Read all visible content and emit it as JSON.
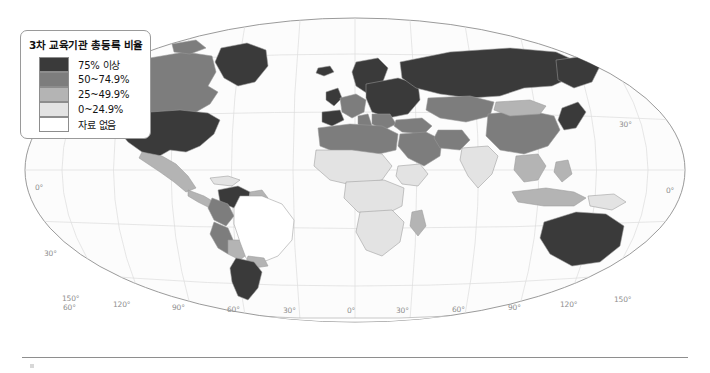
{
  "legend": {
    "title": "3차 교육기관 총등록 비율",
    "items": [
      {
        "label": "75% 이상",
        "color": "#3a3a3a"
      },
      {
        "label": "50~74.9%",
        "color": "#7d7d7d"
      },
      {
        "label": "25~49.9%",
        "color": "#b4b4b4"
      },
      {
        "label": "0~24.9%",
        "color": "#e3e3e3"
      },
      {
        "label": "자료 없음",
        "color": "#ffffff"
      }
    ]
  },
  "graticule": {
    "longitude_labels": [
      {
        "text": "150°",
        "x": 62,
        "y": 294
      },
      {
        "text": "120°",
        "x": 113,
        "y": 300
      },
      {
        "text": "90°",
        "x": 172,
        "y": 303
      },
      {
        "text": "60°",
        "x": 227,
        "y": 305
      },
      {
        "text": "30°",
        "x": 283,
        "y": 306
      },
      {
        "text": "0°",
        "x": 347,
        "y": 306
      },
      {
        "text": "30°",
        "x": 396,
        "y": 306
      },
      {
        "text": "60°",
        "x": 452,
        "y": 305
      },
      {
        "text": "90°",
        "x": 508,
        "y": 303
      },
      {
        "text": "120°",
        "x": 560,
        "y": 300
      },
      {
        "text": "150°",
        "x": 614,
        "y": 295
      }
    ],
    "latitude_labels": [
      {
        "text": "30°",
        "x": 619,
        "y": 120
      },
      {
        "text": "0°",
        "x": 35,
        "y": 183
      },
      {
        "text": "0°",
        "x": 666,
        "y": 186
      },
      {
        "text": "30°",
        "x": 44,
        "y": 249
      },
      {
        "text": "60°",
        "x": 63,
        "y": 303
      }
    ]
  },
  "map": {
    "projection": "mollweide",
    "ocean_color": "#fcfcfc",
    "border_color": "#8e8e8e",
    "graticule_color": "#d6d6d6",
    "country_outline_color": "#9a9a9a",
    "regions": [
      {
        "name": "united-states",
        "class": "c75"
      },
      {
        "name": "canada",
        "class": "c50"
      },
      {
        "name": "mexico",
        "class": "c25"
      },
      {
        "name": "central-america",
        "class": "c25"
      },
      {
        "name": "greenland",
        "class": "c75"
      },
      {
        "name": "venezuela",
        "class": "c75"
      },
      {
        "name": "colombia",
        "class": "c50"
      },
      {
        "name": "peru",
        "class": "c50"
      },
      {
        "name": "bolivia",
        "class": "c25"
      },
      {
        "name": "chile",
        "class": "c75"
      },
      {
        "name": "argentina",
        "class": "c75"
      },
      {
        "name": "brazil",
        "class": "nodata"
      },
      {
        "name": "western-europe",
        "class": "c75"
      },
      {
        "name": "eastern-europe",
        "class": "c75"
      },
      {
        "name": "iberia",
        "class": "c75"
      },
      {
        "name": "north-africa",
        "class": "c50"
      },
      {
        "name": "sub-saharan-africa",
        "class": "c25"
      },
      {
        "name": "middle-east",
        "class": "c50"
      },
      {
        "name": "turkey",
        "class": "c50"
      },
      {
        "name": "russia",
        "class": "c75"
      },
      {
        "name": "central-asia",
        "class": "c50"
      },
      {
        "name": "china",
        "class": "c50"
      },
      {
        "name": "india",
        "class": "c25"
      },
      {
        "name": "southeast-asia",
        "class": "c25"
      },
      {
        "name": "indonesia",
        "class": "c25"
      },
      {
        "name": "japan-korea",
        "class": "c75"
      },
      {
        "name": "australia",
        "class": "c75"
      },
      {
        "name": "new-zealand",
        "class": "c75"
      },
      {
        "name": "antarctica",
        "class": "nodata"
      }
    ]
  }
}
